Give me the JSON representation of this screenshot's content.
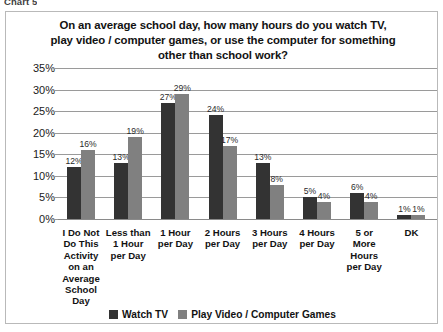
{
  "caption": "Chart 5",
  "chart_data": {
    "type": "bar",
    "title_lines": [
      "On an average school day, how many hours do you watch TV,",
      "play video / computer games, or use the computer for something",
      "other than school work?"
    ],
    "xlabel": "",
    "ylabel": "",
    "ylim": [
      0,
      35
    ],
    "grid": true,
    "legend_position": "bottom",
    "categories": [
      "I Do Not Do This Activity on an Average School Day",
      "Less than 1 Hour per Day",
      "1 Hour per Day",
      "2 Hours per Day",
      "3 Hours per Day",
      "4 Hours per Day",
      "5 or More Hours per Day",
      "DK"
    ],
    "category_lines": [
      [
        "I Do Not",
        "Do This",
        "Activity",
        "on an",
        "Average",
        "School",
        "Day"
      ],
      [
        "Less than",
        "1 Hour",
        "per Day"
      ],
      [
        "1 Hour",
        "per Day"
      ],
      [
        "2 Hours",
        "per Day"
      ],
      [
        "3 Hours",
        "per Day"
      ],
      [
        "4 Hours",
        "per Day"
      ],
      [
        "5 or",
        "More",
        "Hours",
        "per Day"
      ],
      [
        "DK"
      ]
    ],
    "series": [
      {
        "name": "Watch TV",
        "color": "#333333",
        "values": [
          12,
          13,
          27,
          24,
          13,
          5,
          6,
          1
        ],
        "labels": [
          "12%",
          "13%",
          "27%",
          "24%",
          "13%",
          "5%",
          "6%",
          "1%"
        ]
      },
      {
        "name": "Play Video / Computer Games",
        "color": "#808080",
        "values": [
          16,
          19,
          29,
          17,
          8,
          4,
          4,
          1
        ],
        "labels": [
          "16%",
          "19%",
          "29%",
          "17%",
          "8%",
          "4%",
          "4%",
          "1%"
        ]
      }
    ],
    "y_ticks": [
      "0%",
      "5%",
      "10%",
      "15%",
      "20%",
      "25%",
      "30%",
      "35%"
    ],
    "y_tick_values": [
      0,
      5,
      10,
      15,
      20,
      25,
      30,
      35
    ]
  }
}
